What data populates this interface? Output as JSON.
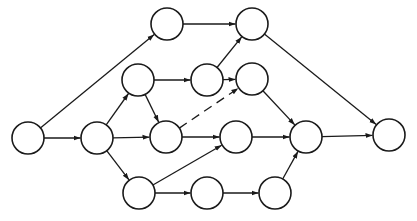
{
  "diagram": {
    "type": "directed-network",
    "node_radius": 16,
    "colors": {
      "stroke": "#1a1a1a",
      "fill": "#ffffff",
      "background": "#ffffff"
    },
    "nodes": [
      {
        "id": "n1",
        "x": 28,
        "y": 138
      },
      {
        "id": "n2",
        "x": 97,
        "y": 138
      },
      {
        "id": "n3",
        "x": 138,
        "y": 80
      },
      {
        "id": "n4",
        "x": 167,
        "y": 24
      },
      {
        "id": "n5",
        "x": 166,
        "y": 137
      },
      {
        "id": "n6",
        "x": 139,
        "y": 193
      },
      {
        "id": "n7",
        "x": 207,
        "y": 80
      },
      {
        "id": "n8",
        "x": 252,
        "y": 24
      },
      {
        "id": "n9",
        "x": 252,
        "y": 79
      },
      {
        "id": "n10",
        "x": 236,
        "y": 137
      },
      {
        "id": "n11",
        "x": 207,
        "y": 193
      },
      {
        "id": "n12",
        "x": 275,
        "y": 193
      },
      {
        "id": "n13",
        "x": 306,
        "y": 137
      },
      {
        "id": "n14",
        "x": 389,
        "y": 135
      }
    ],
    "edges": [
      {
        "from": "n1",
        "to": "n4",
        "style": "solid"
      },
      {
        "from": "n1",
        "to": "n2",
        "style": "solid"
      },
      {
        "from": "n2",
        "to": "n3",
        "style": "solid"
      },
      {
        "from": "n2",
        "to": "n5",
        "style": "solid"
      },
      {
        "from": "n2",
        "to": "n6",
        "style": "solid"
      },
      {
        "from": "n3",
        "to": "n5",
        "style": "solid"
      },
      {
        "from": "n3",
        "to": "n7",
        "style": "solid"
      },
      {
        "from": "n4",
        "to": "n8",
        "style": "solid"
      },
      {
        "from": "n7",
        "to": "n8",
        "style": "solid"
      },
      {
        "from": "n7",
        "to": "n9",
        "style": "solid"
      },
      {
        "from": "n5",
        "to": "n9",
        "style": "dashed"
      },
      {
        "from": "n5",
        "to": "n10",
        "style": "solid"
      },
      {
        "from": "n6",
        "to": "n10",
        "style": "solid"
      },
      {
        "from": "n6",
        "to": "n11",
        "style": "solid"
      },
      {
        "from": "n11",
        "to": "n12",
        "style": "solid"
      },
      {
        "from": "n9",
        "to": "n13",
        "style": "solid"
      },
      {
        "from": "n10",
        "to": "n13",
        "style": "solid"
      },
      {
        "from": "n12",
        "to": "n13",
        "style": "solid"
      },
      {
        "from": "n8",
        "to": "n14",
        "style": "solid"
      },
      {
        "from": "n13",
        "to": "n14",
        "style": "solid"
      }
    ]
  }
}
